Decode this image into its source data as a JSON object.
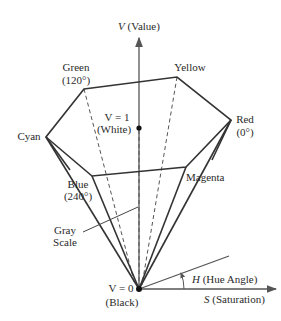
{
  "diagram": {
    "axes": {
      "value": {
        "symbol": "V",
        "label": " (Value)"
      },
      "saturation": {
        "symbol": "S",
        "label": " (Saturation)"
      },
      "hue": {
        "symbol": "H",
        "label": " (Hue Angle)"
      }
    },
    "vertices": {
      "green": {
        "name": "Green",
        "angle": "(120°)"
      },
      "yellow": {
        "name": "Yellow"
      },
      "red": {
        "name": "Red",
        "angle": "(0°)"
      },
      "cyan": {
        "name": "Cyan"
      },
      "blue": {
        "name": "Blue",
        "angle": "(240°)"
      },
      "magenta": {
        "name": "Magenta"
      }
    },
    "points": {
      "white": {
        "eq": "V = 1",
        "name": "(White)"
      },
      "black": {
        "eq": "V = 0",
        "name": "(Black)"
      }
    },
    "gray_scale": {
      "line1": "Gray",
      "line2": "Scale"
    },
    "colors": {
      "line": "#333333",
      "axis": "#555555",
      "text": "#2a2a2a"
    }
  }
}
